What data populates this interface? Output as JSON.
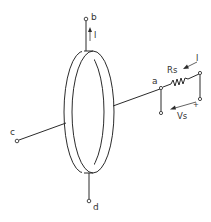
{
  "diagram": {
    "terminals": {
      "a": "a",
      "b": "b",
      "c": "c",
      "d": "d"
    },
    "labels": {
      "current_top": "I",
      "current_right": "I",
      "resistor": "Rs",
      "voltage_source": "Vs",
      "voltage_polarity": "+"
    },
    "colors": {
      "line": "#2b2b2b",
      "background": "#ffffff"
    }
  }
}
